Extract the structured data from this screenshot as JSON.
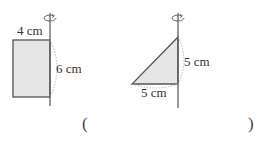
{
  "figures": {
    "rectangle": {
      "width_label": "4 cm",
      "height_label": "6 cm",
      "shape_fill": "#e8e8e8",
      "stroke": "#555555"
    },
    "triangle": {
      "height_label": "5 cm",
      "base_label": "5 cm",
      "shape_fill": "#e8e8e8",
      "stroke": "#555555"
    }
  },
  "answer": {
    "open_paren": "(",
    "close_paren": ")",
    "value": ""
  }
}
